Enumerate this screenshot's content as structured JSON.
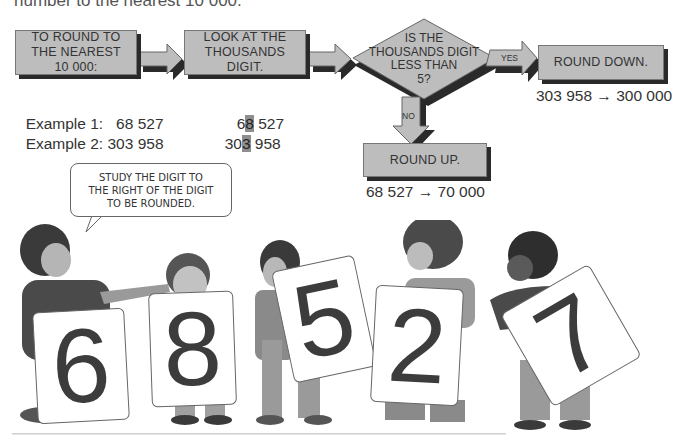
{
  "header": {
    "partial_text": "number to the nearest 10 000."
  },
  "flowchart": {
    "step1": "TO ROUND TO THE NEAREST 10 000:",
    "step1_lines": [
      "TO ROUND TO",
      "THE NEAREST",
      "10 000:"
    ],
    "step2_lines": [
      "LOOK AT THE",
      "THOUSANDS DIGIT."
    ],
    "decision_lines": [
      "IS THE",
      "THOUSANDS DIGIT",
      "LESS THAN",
      "5?"
    ],
    "yes_label": "YES",
    "no_label": "NO",
    "yes_result": "ROUND DOWN.",
    "no_result": "ROUND UP.",
    "colors": {
      "box_fill": "#bdbdbd",
      "box_shadow": "#2a2a2a",
      "highlight": "#8e8e8e"
    }
  },
  "examples": [
    {
      "label": "Example 1:",
      "number": "68 527",
      "highlight_pre": "6",
      "highlight_digit": "8",
      "highlight_post": " 527",
      "result": "68 527 → 70 000"
    },
    {
      "label": "Example 2:",
      "number": "303 958",
      "highlight_pre": "30",
      "highlight_digit": "3",
      "highlight_post": " 958",
      "result": "303 958 → 300 000"
    }
  ],
  "illustration": {
    "speech_bubble_lines": [
      "STUDY THE DIGIT TO",
      "THE RIGHT OF THE DIGIT",
      "TO BE ROUNDED."
    ],
    "cards": [
      "6",
      "8",
      "5",
      "2",
      "7"
    ]
  }
}
